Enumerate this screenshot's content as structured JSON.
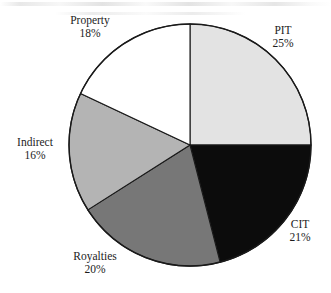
{
  "chart_data": {
    "type": "pie",
    "title": "",
    "subtitle": "",
    "xlabel": "",
    "ylabel": "",
    "legend_position": "none",
    "grid": false,
    "labels_on_slices": false,
    "label_format": "name + percent",
    "total_percent": 100,
    "start_angle_deg": 0,
    "direction": "clockwise",
    "categories": [
      "PIT",
      "CIT",
      "Royalties",
      "Indirect",
      "Property"
    ],
    "values": [
      25,
      21,
      20,
      16,
      18
    ],
    "slices": [
      {
        "name": "PIT",
        "percent": 25,
        "value_label": "25%",
        "color": "#E3E3E3",
        "start_angle_deg": 0,
        "end_angle_deg": 90,
        "label_position": "right-top"
      },
      {
        "name": "CIT",
        "percent": 21,
        "value_label": "21%",
        "color": "#0C0C0C",
        "start_angle_deg": 90,
        "end_angle_deg": 165.6,
        "label_position": "right-bottom"
      },
      {
        "name": "Royalties",
        "percent": 20,
        "value_label": "20%",
        "color": "#777777",
        "start_angle_deg": 165.6,
        "end_angle_deg": 237.6,
        "label_position": "bottom-left"
      },
      {
        "name": "Indirect",
        "percent": 16,
        "value_label": "16%",
        "color": "#B4B4B4",
        "start_angle_deg": 237.6,
        "end_angle_deg": 295.2,
        "label_position": "left"
      },
      {
        "name": "Property",
        "percent": 18,
        "value_label": "18%",
        "color": "#FFFFFF",
        "start_angle_deg": 295.2,
        "end_angle_deg": 360,
        "label_position": "top-left"
      }
    ]
  },
  "labels": {
    "property": {
      "name": "Property",
      "percent": "18%"
    },
    "pit": {
      "name": "PIT",
      "percent": "25%"
    },
    "cit": {
      "name": "CIT",
      "percent": "21%"
    },
    "royalties": {
      "name": "Royalties",
      "percent": "20%"
    },
    "indirect": {
      "name": "Indirect",
      "percent": "16%"
    }
  },
  "style": {
    "outline_color": "#1a1a1a",
    "background": "#FFFFFF"
  }
}
